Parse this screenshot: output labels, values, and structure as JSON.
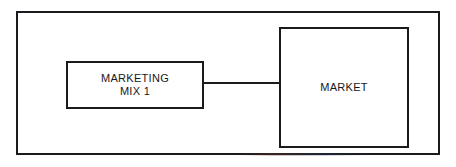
{
  "diagram": {
    "background_color": "#ffffff",
    "line_color": "#1b1b1f",
    "frame": {
      "label": "outer-frame"
    },
    "nodes": [
      {
        "id": "marketing-mix-1",
        "label": "MARKETING\nMIX 1",
        "shape": "rectangle"
      },
      {
        "id": "market",
        "label": "MARKET",
        "shape": "rectangle"
      }
    ],
    "connectors": [
      {
        "id": "mix-to-market",
        "from": "marketing-mix-1",
        "to": "market",
        "style": "solid-line",
        "arrowheads": "none"
      }
    ]
  }
}
